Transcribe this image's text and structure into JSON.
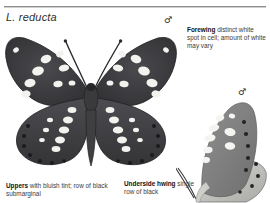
{
  "page": {
    "species_name": "L. reducta",
    "background_color": "#ffffff",
    "rule_color": "#8d8d8d"
  },
  "sex_symbols": {
    "upperside_male": "♂",
    "underside_male": "♂"
  },
  "captions": {
    "forewing": {
      "lead": "Forewing",
      "body": " distinct white spot in cell; amount of white may vary"
    },
    "uppers": {
      "lead": "Uppers",
      "body": " with bluish tint; row of black submarginal"
    },
    "underside": {
      "lead": "Underside hwing",
      "body": " single row of black"
    }
  },
  "figures": {
    "upperside": {
      "label": "upperside-specimen",
      "wing_color": "#3b3b3f",
      "body_color": "#2a2a2d",
      "spot_color": "#f4f4f2"
    },
    "underside": {
      "label": "underside-specimen",
      "wing_color": "#9a9a9a",
      "spot_color": "#f2f2ee",
      "dot_color": "#2b2b2b"
    }
  }
}
